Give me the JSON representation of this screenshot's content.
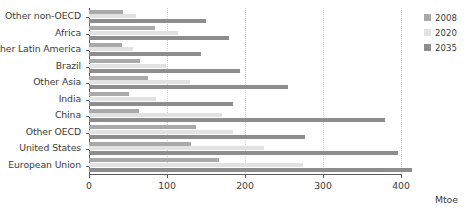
{
  "chart_data": {
    "type": "bar",
    "orientation": "horizontal",
    "title": "",
    "xlabel": "Mtoe",
    "ylabel": "",
    "xlim": [
      0,
      400
    ],
    "xticks": [
      0,
      100,
      200,
      300,
      400
    ],
    "xtick_labels": [
      "0",
      "100",
      "200",
      "300",
      "400"
    ],
    "grid": "vertical-dotted",
    "legend_position": "right",
    "categories": [
      "Other non-OECD",
      "Africa",
      "Other Latin America",
      "Brazil",
      "Other Asia",
      "India",
      "China",
      "Other OECD",
      "United States",
      "European Union"
    ],
    "series": [
      {
        "name": "2008",
        "color": "#a9a9a9",
        "values": [
          44,
          85,
          42,
          65,
          76,
          51,
          64,
          137,
          131,
          167
        ]
      },
      {
        "name": "2020",
        "color": "#e2e2e2",
        "values": [
          60,
          114,
          56,
          99,
          129,
          86,
          170,
          185,
          224,
          274
        ]
      },
      {
        "name": "2035",
        "color": "#8d8d8d",
        "values": [
          150,
          180,
          143,
          194,
          255,
          184,
          380,
          277,
          396,
          414
        ]
      }
    ]
  },
  "legend": {
    "items": [
      {
        "label": "2008",
        "color": "#a9a9a9"
      },
      {
        "label": "2020",
        "color": "#e2e2e2"
      },
      {
        "label": "2035",
        "color": "#8d8d8d"
      }
    ]
  },
  "axis": {
    "x_title": "Mtoe"
  }
}
